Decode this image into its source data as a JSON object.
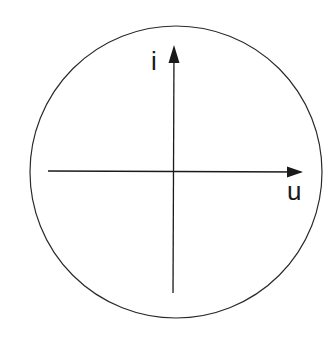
{
  "diagram": {
    "type": "axes-in-circle",
    "circle": {
      "cx": 176,
      "cy": 172,
      "r": 146,
      "stroke": "#2a2a2a"
    },
    "axes": {
      "horizontal": {
        "label": "u",
        "direction": "right"
      },
      "vertical": {
        "label": "i",
        "direction": "up"
      }
    },
    "stroke_color": "#1a1a1a"
  }
}
